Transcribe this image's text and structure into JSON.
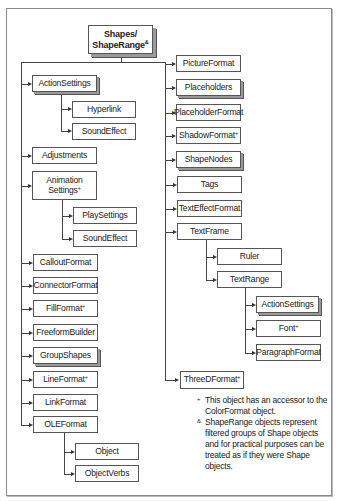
{
  "root": {
    "line1": "Shapes/",
    "line2": "ShapeRange",
    "marker": "&"
  },
  "left_column": [
    {
      "label": "ActionSettings",
      "collection": true,
      "children": [
        "Hyperlink",
        "SoundEffect"
      ]
    },
    {
      "label": "Adjustments"
    },
    {
      "label_line1": "Animation",
      "label_line2": "Settings",
      "marker": "+",
      "children": [
        "PlaySettings",
        "SoundEffect"
      ]
    },
    {
      "label": "CalloutFormat"
    },
    {
      "label": "ConnectorFormat"
    },
    {
      "label": "FillFormat",
      "marker": "+"
    },
    {
      "label": "FreeformBuilder"
    },
    {
      "label": "GroupShapes",
      "collection": true
    },
    {
      "label": "LineFormat",
      "marker": "+"
    },
    {
      "label": "LinkFormat"
    },
    {
      "label": "OLEFormat",
      "children": [
        "Object",
        "ObjectVerbs"
      ]
    }
  ],
  "right_column": [
    {
      "label": "PictureFormat"
    },
    {
      "label": "Placeholders",
      "collection": true
    },
    {
      "label": "PlaceholderFormat"
    },
    {
      "label": "ShadowFormat",
      "marker": "+"
    },
    {
      "label": "ShapeNodes",
      "collection": true
    },
    {
      "label": "Tags"
    },
    {
      "label": "TextEffectFormat"
    },
    {
      "label": "TextFrame",
      "children": [
        "Ruler",
        "TextRange"
      ]
    },
    {
      "label": "ThreeDFormat",
      "marker": "+"
    }
  ],
  "textrange_children": [
    {
      "label": "ActionSettings",
      "collection": true
    },
    {
      "label": "Font",
      "marker": "+"
    },
    {
      "label": "ParagraphFormat"
    }
  ],
  "labels": {
    "ActionSettings": "ActionSettings",
    "Hyperlink": "Hyperlink",
    "SoundEffect": "SoundEffect",
    "Adjustments": "Adjustments",
    "Animation": "Animation",
    "Settings": "Settings",
    "PlaySettings": "PlaySettings",
    "SoundEffect2": "SoundEffect",
    "CalloutFormat": "CalloutFormat",
    "ConnectorFormat": "ConnectorFormat",
    "FillFormat": "FillFormat",
    "FreeformBuilder": "FreeformBuilder",
    "GroupShapes": "GroupShapes",
    "LineFormat": "LineFormat",
    "LinkFormat": "LinkFormat",
    "OLEFormat": "OLEFormat",
    "Object": "Object",
    "ObjectVerbs": "ObjectVerbs",
    "PictureFormat": "PictureFormat",
    "Placeholders": "Placeholders",
    "PlaceholderFormat": "PlaceholderFormat",
    "ShadowFormat": "ShadowFormat",
    "ShapeNodes": "ShapeNodes",
    "Tags": "Tags",
    "TextEffectFormat": "TextEffectFormat",
    "TextFrame": "TextFrame",
    "Ruler": "Ruler",
    "TextRange": "TextRange",
    "ActionSettings2": "ActionSettings",
    "Font": "Font",
    "ParagraphFormat": "ParagraphFormat",
    "ThreeDFormat": "ThreeDFormat"
  },
  "markers": {
    "color": "+",
    "range": "&"
  },
  "footnotes": [
    {
      "marker": "+",
      "text": "This object has an accessor to the ColorFormat object."
    },
    {
      "marker": "&",
      "text": "ShapeRange objects represent filtered groups of Shape objects and for practical purposes can be treated as if they were Shape objects."
    }
  ]
}
